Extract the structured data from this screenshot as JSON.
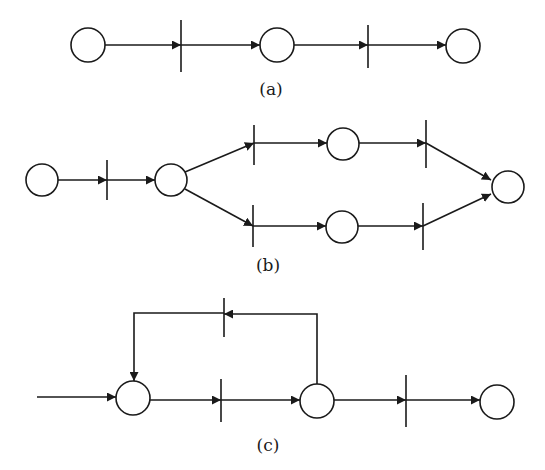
{
  "figure": {
    "colors": {
      "stroke": "#1a1a1a",
      "background": "#ffffff",
      "place_fill": "#ffffff"
    },
    "subfigures": [
      {
        "id": "a",
        "label": "(a)",
        "description": "Sequential Petri net: place -> transition -> place -> transition -> place"
      },
      {
        "id": "b",
        "label": "(b)",
        "description": "Concurrent Petri net: place -> transition -> place forks into two parallel branches (transition -> place -> transition) that join into a final place"
      },
      {
        "id": "c",
        "label": "(c)",
        "description": "Petri net with loop: input arc -> place -> transition -> place -> transition -> place, with feedback arc from second place through a transition back to first place"
      }
    ],
    "elements": {
      "places": 13,
      "transitions": 10
    }
  }
}
